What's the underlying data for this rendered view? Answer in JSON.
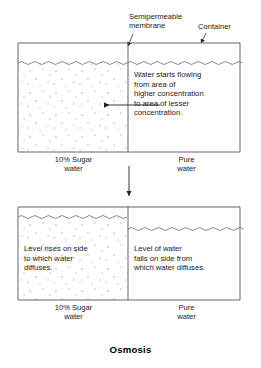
{
  "title": "Osmosis",
  "annotations": {
    "membrane_label": "Semipermeable\nmembrane",
    "container_label": "Container"
  },
  "top_vessel": {
    "caption": "Water starts flowing\nfrom area of\nhigher concentration\nto area of lesser\nconcentration.",
    "left_label": "10% Sugar\nwater",
    "right_label": "Pure\nwater",
    "flow_arrow_direction": "left",
    "left_water_level": "equal",
    "right_water_level": "equal"
  },
  "bottom_vessel": {
    "left_caption": "Level rises on side\nto which water\ndiffuses.",
    "right_caption": "Level of water\nfalls on side from\nwhich water diffuses.",
    "left_label": "10% Sugar\nwater",
    "right_label": "Pure\nwater",
    "left_water_level": "raised",
    "right_water_level": "lowered"
  },
  "process_arrow": {
    "direction": "down"
  },
  "colors": {
    "stroke": "#555555",
    "text": "#1a1a1a",
    "solute_dot": "#b9b9c6",
    "water_line": "#6b6b6b",
    "background": "#ffffff"
  }
}
